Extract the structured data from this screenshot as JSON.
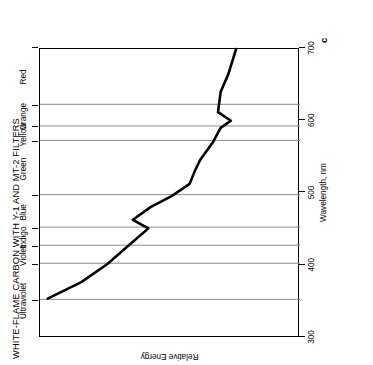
{
  "figure": {
    "title": "WHITE-FLAME CARBON WITH Y-1 AND MT-2 FILTERS",
    "letter": "c",
    "orientation": "rotated-90-ccw"
  },
  "axes": {
    "x_title": "Wavelength, nm",
    "y_title": "Relative Energy",
    "x_ticks": [
      "300",
      "400",
      "500",
      "600",
      "700"
    ]
  },
  "bands": [
    {
      "name": "Ultraviolet",
      "label": "Ultraviolet"
    },
    {
      "name": "Violet",
      "label": "Violet"
    },
    {
      "name": "Indigo",
      "label": "Indigo"
    },
    {
      "name": "Blue",
      "label": "Blue"
    },
    {
      "name": "Green",
      "label": "Green"
    },
    {
      "name": "Yellow",
      "label": "Yellow"
    },
    {
      "name": "Orange",
      "label": "Orange"
    },
    {
      "name": "Red",
      "label": "Red"
    }
  ],
  "chart_data": {
    "type": "line",
    "title": "WHITE-FLAME CARBON WITH Y-1 AND MT-2 FILTERS",
    "xlabel": "Wavelength, nm",
    "ylabel": "Relative Energy",
    "xlim": [
      300,
      700
    ],
    "ylim": [
      0,
      100
    ],
    "grid": true,
    "grid_axis": "x",
    "legend": "none",
    "xticks": [
      300,
      400,
      500,
      600,
      700
    ],
    "yticks": [],
    "band_boundaries_nm": [
      350,
      400,
      425,
      450,
      495,
      570,
      590,
      620,
      700
    ],
    "bands": [
      {
        "label": "Ultraviolet",
        "from_nm": 300,
        "to_nm": 400
      },
      {
        "label": "Violet",
        "from_nm": 400,
        "to_nm": 425
      },
      {
        "label": "Indigo",
        "from_nm": 425,
        "to_nm": 450
      },
      {
        "label": "Blue",
        "from_nm": 450,
        "to_nm": 495
      },
      {
        "label": "Green",
        "from_nm": 495,
        "to_nm": 570
      },
      {
        "label": "Yellow",
        "from_nm": 570,
        "to_nm": 590
      },
      {
        "label": "Orange",
        "from_nm": 590,
        "to_nm": 620
      },
      {
        "label": "Red",
        "from_nm": 620,
        "to_nm": 700
      }
    ],
    "series": [
      {
        "name": "Relative Energy",
        "x": [
          352,
          375,
          400,
          425,
          450,
          462,
          480,
          495,
          512,
          530,
          545,
          570,
          590,
          600,
          612,
          640,
          665,
          700
        ],
        "y": [
          97,
          84,
          74,
          66,
          58,
          64,
          57,
          49,
          42,
          40,
          38,
          33,
          30,
          26,
          31,
          30,
          27,
          24
        ]
      }
    ]
  }
}
